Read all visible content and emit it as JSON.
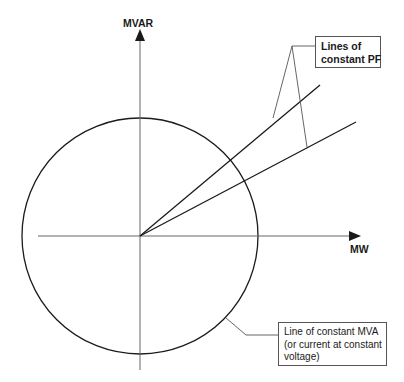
{
  "diagram": {
    "axes": {
      "vertical_label": "MVAR",
      "horizontal_label": "MW"
    },
    "callouts": {
      "pf": {
        "lines": [
          "Lines of",
          "constant PF"
        ]
      },
      "mva": {
        "lines": [
          "Line of constant MVA",
          "(or current at constant",
          "voltage)"
        ]
      }
    },
    "colors": {
      "stroke": "#1a1a1a",
      "leader": "#555555",
      "background": "#ffffff"
    },
    "geometry": {
      "origin": [
        140,
        236
      ],
      "circle_radius": 118,
      "pf_line_ends": [
        [
          320,
          85
        ],
        [
          356,
          122
        ]
      ]
    }
  }
}
